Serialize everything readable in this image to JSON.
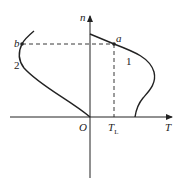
{
  "diagram": {
    "axes": {
      "y_label": "n",
      "x_label": "T",
      "origin_label": "O",
      "tick_label": "T",
      "tick_subscript": "L"
    },
    "points": [
      {
        "name": "a",
        "label": "a"
      },
      {
        "name": "b",
        "label": "b"
      }
    ],
    "curves": [
      {
        "id": "1",
        "label": "1"
      },
      {
        "id": "2",
        "label": "2"
      }
    ],
    "colors": {
      "line": "#222222",
      "background": "#ffffff"
    }
  }
}
